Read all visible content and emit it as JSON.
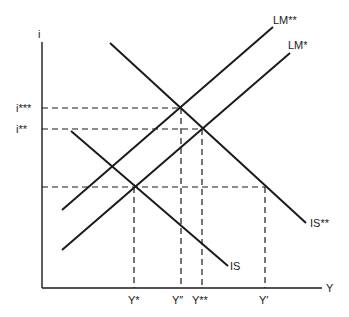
{
  "diagram": {
    "type": "IS-LM diagram",
    "axes": {
      "y_label": "i",
      "x_label": "Y"
    },
    "curves": {
      "lm_double_star": "LM**",
      "lm_star": "LM*",
      "is": "IS",
      "is_double_star": "IS**"
    },
    "interest_levels": {
      "i_triple_star": "i***",
      "i_double_star": "i**"
    },
    "output_levels": {
      "y_star": "Y*",
      "y_double_prime": "Y″",
      "y_double_star": "Y**",
      "y_prime": "Y′"
    }
  }
}
